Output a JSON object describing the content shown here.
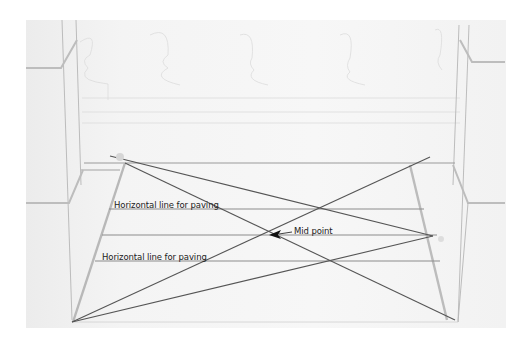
{
  "labels": {
    "horizontal_line_1": "Horizontal line for paving",
    "horizontal_line_2": "Horizontal line for paving",
    "mid_point": "Mid point"
  },
  "colors": {
    "pencil": "#8a8a8a",
    "pencil_light": "#c8c8c8",
    "construction": "#555555",
    "arrow": "#111111"
  }
}
